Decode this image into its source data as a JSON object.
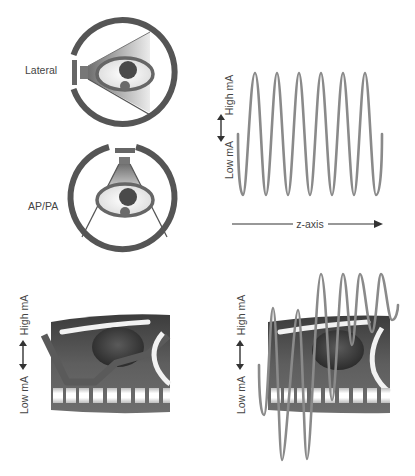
{
  "panels": {
    "lateral": {
      "label": "Lateral"
    },
    "appa": {
      "label": "AP/PA"
    },
    "constant_wave": {
      "high_label": "High mA",
      "low_label": "Low mA",
      "axis_label": "z-axis"
    },
    "body_lateral": {
      "high_label": "High mA",
      "low_label": "Low mA"
    },
    "body_modulated": {
      "high_label": "High mA",
      "low_label": "Low mA"
    }
  },
  "colors": {
    "ring": "#555555",
    "wave": "#8a8a8a",
    "body_dark": "#4a4a4a",
    "body_mid": "#6a6a6a",
    "text": "#444444",
    "arrow": "#333333"
  }
}
